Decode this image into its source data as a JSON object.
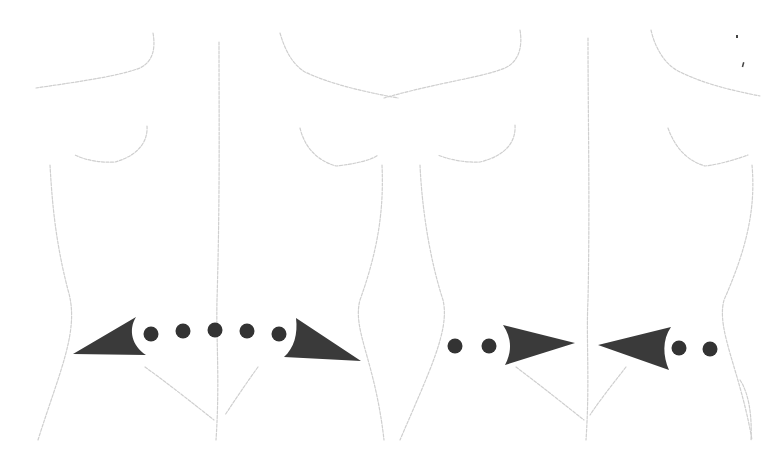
{
  "figure": {
    "type": "anatomical-illustration",
    "view": "posterior torso",
    "panels": [
      {
        "id": "left",
        "description": "outward-pointing arrows at waist level",
        "direction": "divergent",
        "dot_count": 5,
        "arrow_count": 2
      },
      {
        "id": "right",
        "description": "inward-pointing arrows toward spine at waist level",
        "direction": "convergent",
        "dot_count": 4,
        "arrow_count": 2
      }
    ],
    "colors": {
      "background": "#ffffff",
      "outline": "#cfcfcf",
      "arrow": "#3a3a3a",
      "dot": "#333333"
    }
  }
}
